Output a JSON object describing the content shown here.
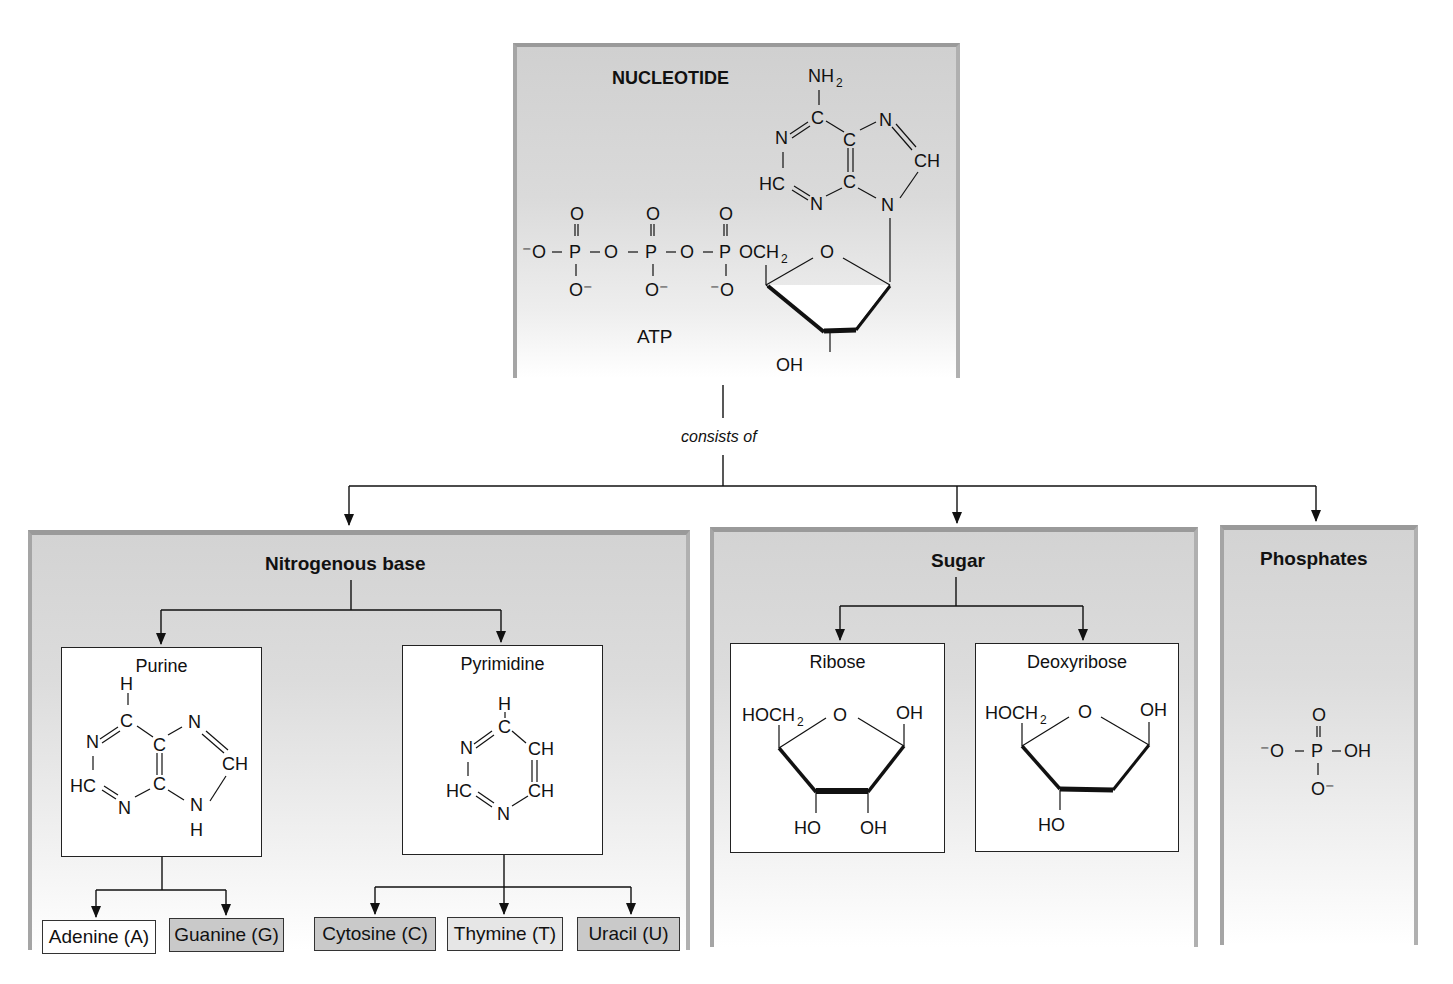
{
  "nucleotide": {
    "title": "NUCLEOTIDE",
    "molecule_label": "ATP",
    "connector_label": "consists of"
  },
  "components": [
    {
      "title": "Nitrogenous base",
      "subtypes": [
        {
          "title": "Purine",
          "members": [
            {
              "label": "Adenine (A)",
              "fill": "#ffffff"
            },
            {
              "label": "Guanine (G)",
              "fill": "#c9c9c9"
            }
          ]
        },
        {
          "title": "Pyrimidine",
          "members": [
            {
              "label": "Cytosine (C)",
              "fill": "#c9c9c9"
            },
            {
              "label": "Thymine (T)",
              "fill": "#e6e6e6"
            },
            {
              "label": "Uracil (U)",
              "fill": "#c9c9c9"
            }
          ]
        }
      ]
    },
    {
      "title": "Sugar",
      "subtypes": [
        {
          "title": "Ribose"
        },
        {
          "title": "Deoxyribose"
        }
      ]
    },
    {
      "title": "Phosphates"
    }
  ],
  "chem_labels": {
    "atp": [
      "NH2",
      "N",
      "C",
      "N",
      "CH",
      "HC",
      "C",
      "N",
      "N",
      "O",
      "O",
      "O",
      "P",
      "P",
      "P",
      "OCH2",
      "O",
      "OH"
    ],
    "ribose": [
      "HOCH2",
      "O",
      "OH",
      "HO",
      "OH"
    ],
    "deoxyribose": [
      "HOCH2",
      "O",
      "OH",
      "HO"
    ],
    "phosphate": [
      "O",
      "O",
      "P",
      "OH",
      "O"
    ]
  },
  "colors": {
    "panel_gray": "#d3d3d3",
    "panel_border": "#9a9a9a",
    "chip_dark": "#c9c9c9",
    "chip_light": "#e6e6e6",
    "line": "#111111"
  }
}
